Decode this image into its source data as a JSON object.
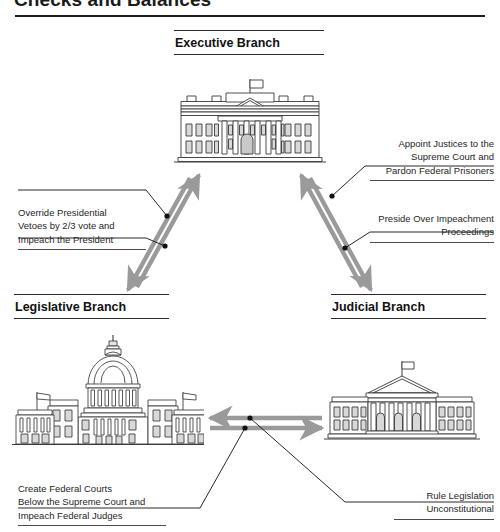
{
  "document": {
    "title": "Checks and Balances"
  },
  "branches": {
    "executive": {
      "heading": "Executive Branch",
      "icon": "white-house-icon"
    },
    "legislative": {
      "heading": "Legislative Branch",
      "icon": "capitol-building-icon"
    },
    "judicial": {
      "heading": "Judicial Branch",
      "icon": "supreme-court-icon"
    }
  },
  "captions": {
    "appoint": "Appoint Justices to the\nSupreme Court and\nPardon Federal Prisoners",
    "preside": "Preside Over Impeachment\nProceedings",
    "override": "Override Presidential\nVetoes by 2/3 vote and\nImpeach the President",
    "create_courts": "Create Federal Courts\nBelow the Supreme Court and\nImpeach Federal Judges",
    "rule_unconstitutional": "Rule Legislation\nUnconstitutional"
  },
  "colors": {
    "arrow": "#9a9a9a",
    "rule": "#1d1d1d",
    "text": "#1a1a1a",
    "caption_text": "#262626",
    "leader": "#111111",
    "building_stroke": "#3a3a3a",
    "building_fill": "#ffffff",
    "building_shade": "#d8d8d8"
  },
  "arrows": [
    {
      "name": "executive-to-legislative",
      "direction": "down-left"
    },
    {
      "name": "legislative-to-executive",
      "direction": "up-right"
    },
    {
      "name": "executive-to-judicial",
      "direction": "down-right"
    },
    {
      "name": "judicial-to-executive",
      "direction": "up-left"
    },
    {
      "name": "judicial-to-legislative",
      "direction": "left"
    },
    {
      "name": "legislative-to-judicial",
      "direction": "right"
    }
  ]
}
